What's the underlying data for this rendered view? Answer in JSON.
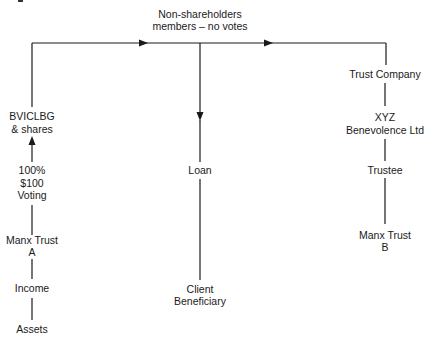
{
  "diagram": {
    "header": {
      "line1": "Non-shareholders",
      "line2": "members – no votes"
    },
    "left_column": {
      "bviclbg": {
        "line1": "BVICLBG",
        "line2": "& shares"
      },
      "ownership": {
        "line1": "100%",
        "line2": "$100",
        "line3": "Voting"
      },
      "manx_trust_a": {
        "line1": "Manx Trust",
        "line2": "A"
      },
      "income": "Income",
      "assets": "Assets"
    },
    "center_column": {
      "loan": "Loan",
      "client_beneficiary": {
        "line1": "Client",
        "line2": "Beneficiary"
      }
    },
    "right_column": {
      "trust_company": "Trust Company",
      "xyz": {
        "line1": "XYZ",
        "line2": "Benevolence Ltd"
      },
      "trustee": "Trustee",
      "manx_trust_b": {
        "line1": "Manx Trust",
        "line2": "B"
      }
    },
    "colors": {
      "ink": "#1a1a1a",
      "background": "#ffffff"
    }
  }
}
